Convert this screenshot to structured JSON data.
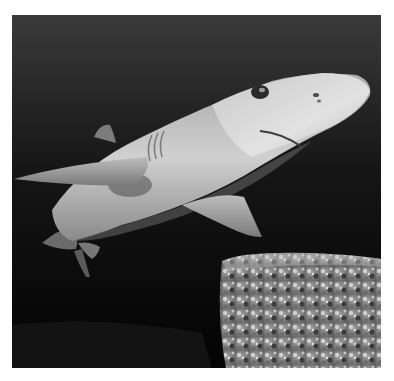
{
  "image": {
    "subject": "shark",
    "description": "Black-and-white underwater photograph of a shark swimming over a speckled rock",
    "colors": {
      "background_top": "#3a3a3a",
      "background_bottom": "#050505",
      "shark_light": "#d8d8d8",
      "shark_mid": "#9a9a9a",
      "rock_light": "#b0b0b0",
      "rock_dark": "#4a4a4a",
      "page": "#ffffff"
    }
  }
}
